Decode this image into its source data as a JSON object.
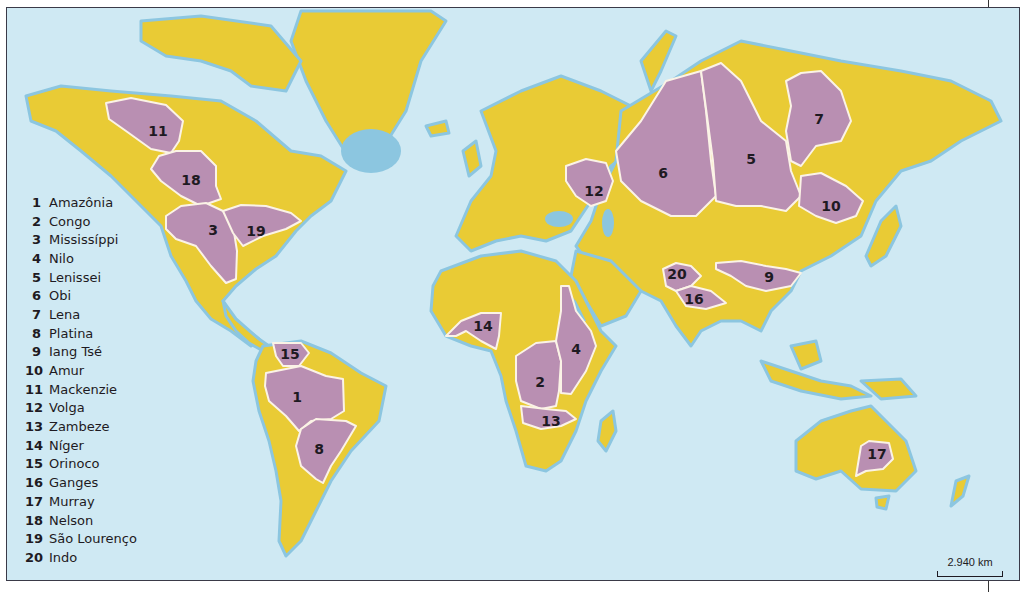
{
  "map": {
    "colors": {
      "ocean": "#cfe9f3",
      "land": "#e9cb35",
      "basin": "#b98fb2",
      "basin_border": "#fbf3e6",
      "coast": "#8cc6e0",
      "frame": "#3a3a48"
    },
    "basins": [
      {
        "id": 1,
        "name": "Amazônia",
        "label": "1",
        "x": 296,
        "y": 396
      },
      {
        "id": 2,
        "name": "Congo",
        "label": "2",
        "x": 533,
        "y": 381
      },
      {
        "id": 3,
        "name": "Mississíppi",
        "label": "3",
        "x": 206,
        "y": 229
      },
      {
        "id": 4,
        "name": "Nilo",
        "label": "4",
        "x": 569,
        "y": 348
      },
      {
        "id": 5,
        "name": "Lenissei",
        "label": "5",
        "x": 744,
        "y": 158
      },
      {
        "id": 6,
        "name": "Obi",
        "label": "6",
        "x": 656,
        "y": 165
      },
      {
        "id": 7,
        "name": "Lena",
        "label": "7",
        "x": 812,
        "y": 113
      },
      {
        "id": 8,
        "name": "Platina",
        "label": "8",
        "x": 312,
        "y": 443
      },
      {
        "id": 9,
        "name": "Iang Tsé",
        "label": "9",
        "x": 762,
        "y": 271
      },
      {
        "id": 10,
        "name": "Amur",
        "label": "10",
        "x": 824,
        "y": 200
      },
      {
        "id": 11,
        "name": "Mackenzie",
        "label": "11",
        "x": 151,
        "y": 125
      },
      {
        "id": 12,
        "name": "Volga",
        "label": "12",
        "x": 587,
        "y": 185
      },
      {
        "id": 13,
        "name": "Zambeze",
        "label": "13",
        "x": 544,
        "y": 415
      },
      {
        "id": 14,
        "name": "Níger",
        "label": "14",
        "x": 476,
        "y": 318
      },
      {
        "id": 15,
        "name": "Orinoco",
        "label": "15",
        "x": 283,
        "y": 348
      },
      {
        "id": 16,
        "name": "Ganges",
        "label": "16",
        "x": 687,
        "y": 292
      },
      {
        "id": 17,
        "name": "Murray",
        "label": "17",
        "x": 870,
        "y": 446
      },
      {
        "id": 18,
        "name": "Nelson",
        "label": "18",
        "x": 184,
        "y": 172
      },
      {
        "id": 19,
        "name": "São Lourenço",
        "label": "19",
        "x": 249,
        "y": 226
      },
      {
        "id": 20,
        "name": "Indo",
        "label": "20",
        "x": 670,
        "y": 267
      }
    ]
  },
  "legend": {
    "items": [
      {
        "num": "1",
        "name": "Amazônia"
      },
      {
        "num": "2",
        "name": "Congo"
      },
      {
        "num": "3",
        "name": "Mississíppi"
      },
      {
        "num": "4",
        "name": "Nilo"
      },
      {
        "num": "5",
        "name": "Lenissei"
      },
      {
        "num": "6",
        "name": "Obi"
      },
      {
        "num": "7",
        "name": "Lena"
      },
      {
        "num": "8",
        "name": "Platina"
      },
      {
        "num": "9",
        "name": "Iang Tsé"
      },
      {
        "num": "10",
        "name": "Amur"
      },
      {
        "num": "11",
        "name": "Mackenzie"
      },
      {
        "num": "12",
        "name": "Volga"
      },
      {
        "num": "13",
        "name": "Zambeze"
      },
      {
        "num": "14",
        "name": "Níger"
      },
      {
        "num": "15",
        "name": "Orinoco"
      },
      {
        "num": "16",
        "name": "Ganges"
      },
      {
        "num": "17",
        "name": "Murray"
      },
      {
        "num": "18",
        "name": "Nelson"
      },
      {
        "num": "19",
        "name": "São Lourenço"
      },
      {
        "num": "20",
        "name": "Indo"
      }
    ]
  },
  "scale": {
    "label": "2.940 km"
  }
}
